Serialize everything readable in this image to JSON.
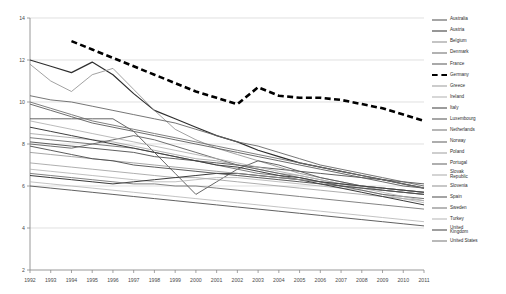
{
  "chart_data": {
    "type": "line",
    "title": "",
    "xlabel": "",
    "ylabel": "",
    "xlim": [
      1992,
      2011
    ],
    "ylim": [
      2,
      14
    ],
    "yticks": [
      2,
      4,
      6,
      8,
      10,
      12,
      14
    ],
    "grid": "horizontal",
    "legend_position": "right",
    "x": [
      1992,
      1993,
      1994,
      1995,
      1996,
      1997,
      1998,
      1999,
      2000,
      2001,
      2002,
      2003,
      2004,
      2005,
      2006,
      2007,
      2008,
      2009,
      2010,
      2011
    ],
    "highlight_series": "Germany",
    "colors": {
      "highlight": "#000000",
      "default_dark": "#3c3c3c",
      "default_mid": "#707070",
      "default_light": "#a8a8a8",
      "grid": "#d2d2d2",
      "axis": "#8c8c8c",
      "text": "#3a3a3a"
    },
    "series": [
      {
        "name": "Australia",
        "style": "solid",
        "width": 0.9,
        "color": "#4d4d4d",
        "values": [
          8.1,
          8.0,
          7.9,
          7.8,
          7.7,
          7.6,
          7.4,
          7.3,
          7.2,
          7.1,
          7.0,
          6.9,
          6.8,
          6.7,
          6.6,
          6.5,
          6.4,
          6.3,
          6.2,
          6.1
        ]
      },
      {
        "name": "Austria",
        "style": "solid",
        "width": 1.2,
        "color": "#2e2e2e",
        "values": [
          12.0,
          11.7,
          11.4,
          11.9,
          11.3,
          10.4,
          9.6,
          9.2,
          8.8,
          8.4,
          8.1,
          7.7,
          7.4,
          7.1,
          6.9,
          6.7,
          6.5,
          6.3,
          6.1,
          5.9
        ]
      },
      {
        "name": "Belgium",
        "style": "solid",
        "width": 0.8,
        "color": "#8a8a8a",
        "values": [
          11.8,
          11.0,
          10.5,
          11.3,
          11.6,
          10.6,
          9.6,
          8.7,
          8.2,
          7.8,
          7.5,
          7.2,
          6.9,
          6.6,
          6.4,
          6.2,
          6.0,
          5.8,
          5.7,
          5.6
        ]
      },
      {
        "name": "Denmark",
        "style": "solid",
        "width": 0.9,
        "color": "#666666",
        "values": [
          10.3,
          10.1,
          10.0,
          9.8,
          9.6,
          9.4,
          9.2,
          9.0,
          8.7,
          8.4,
          8.1,
          7.9,
          7.6,
          7.3,
          7.0,
          6.8,
          6.6,
          6.4,
          6.2,
          6.0
        ]
      },
      {
        "name": "France",
        "style": "solid",
        "width": 0.9,
        "color": "#555555",
        "values": [
          9.2,
          9.2,
          9.2,
          9.2,
          9.2,
          8.6,
          7.6,
          6.6,
          5.6,
          6.2,
          6.8,
          7.2,
          7.0,
          6.7,
          6.4,
          6.2,
          6.0,
          5.9,
          5.8,
          5.7
        ]
      },
      {
        "name": "Germany",
        "style": "dashed",
        "width": 2.6,
        "color": "#000000",
        "values": [
          null,
          null,
          12.9,
          12.5,
          12.1,
          11.7,
          11.3,
          10.9,
          10.5,
          10.2,
          9.9,
          10.7,
          10.3,
          10.2,
          10.2,
          10.1,
          9.9,
          9.7,
          9.4,
          9.1
        ]
      },
      {
        "name": "Greece",
        "style": "solid",
        "width": 0.8,
        "color": "#9a9a9a",
        "values": [
          7.1,
          7.0,
          6.9,
          6.8,
          6.7,
          6.6,
          6.5,
          6.4,
          6.4,
          6.3,
          6.2,
          6.1,
          6.0,
          5.9,
          5.8,
          5.7,
          5.6,
          5.5,
          5.4,
          5.3
        ]
      },
      {
        "name": "Ireland",
        "style": "solid",
        "width": 0.8,
        "color": "#b0b0b0",
        "values": [
          6.8,
          6.7,
          6.6,
          6.5,
          6.4,
          6.3,
          6.2,
          6.2,
          6.3,
          6.4,
          6.4,
          6.3,
          6.2,
          6.1,
          6.0,
          5.9,
          5.8,
          5.6,
          5.4,
          5.2
        ]
      },
      {
        "name": "Italy",
        "style": "solid",
        "width": 1.0,
        "color": "#3a3a3a",
        "values": [
          6.5,
          6.4,
          6.3,
          6.2,
          6.1,
          6.2,
          6.3,
          6.4,
          6.5,
          6.6,
          6.6,
          6.5,
          6.4,
          6.3,
          6.1,
          5.9,
          5.7,
          5.5,
          5.3,
          5.1
        ]
      },
      {
        "name": "Luxembourg",
        "style": "solid",
        "width": 0.9,
        "color": "#4f4f4f",
        "values": [
          6.0,
          5.9,
          5.8,
          5.7,
          5.6,
          5.5,
          5.4,
          5.3,
          5.2,
          5.1,
          5.0,
          4.9,
          4.8,
          4.7,
          4.6,
          4.5,
          4.4,
          4.3,
          4.2,
          4.1
        ]
      },
      {
        "name": "Netherlands",
        "style": "solid",
        "width": 0.9,
        "color": "#6e6e6e",
        "values": [
          8.3,
          8.2,
          8.1,
          8.0,
          7.9,
          7.8,
          7.6,
          7.4,
          7.2,
          7.0,
          6.8,
          6.6,
          6.5,
          6.3,
          6.2,
          6.0,
          5.9,
          5.8,
          5.7,
          5.6
        ]
      },
      {
        "name": "Norway",
        "style": "solid",
        "width": 0.9,
        "color": "#5c5c5c",
        "values": [
          9.9,
          9.6,
          9.3,
          9.0,
          8.8,
          8.6,
          8.4,
          8.2,
          8.0,
          7.8,
          7.6,
          7.4,
          7.2,
          7.0,
          6.8,
          6.6,
          6.4,
          6.2,
          6.0,
          5.9
        ]
      },
      {
        "name": "Poland",
        "style": "solid",
        "width": 0.8,
        "color": "#9d9d9d",
        "values": [
          8.5,
          8.4,
          8.3,
          8.2,
          8.1,
          7.9,
          7.7,
          7.5,
          7.3,
          7.2,
          7.0,
          6.8,
          6.6,
          6.5,
          6.3,
          6.1,
          6.0,
          5.9,
          5.8,
          5.7
        ]
      },
      {
        "name": "Portugal",
        "style": "solid",
        "width": 0.9,
        "color": "#606060",
        "values": [
          8.0,
          7.9,
          7.8,
          8.0,
          8.2,
          8.4,
          8.2,
          7.9,
          7.6,
          7.3,
          7.0,
          6.8,
          6.6,
          6.4,
          6.2,
          6.0,
          5.8,
          5.6,
          5.5,
          5.4
        ]
      },
      {
        "name": "Slovak Republic",
        "style": "solid",
        "width": 0.8,
        "color": "#aaaaaa",
        "values": [
          9.1,
          8.9,
          8.7,
          8.5,
          8.3,
          8.1,
          7.9,
          7.7,
          7.5,
          7.3,
          7.1,
          6.9,
          6.7,
          6.5,
          6.3,
          6.1,
          5.9,
          5.7,
          5.5,
          5.3
        ]
      },
      {
        "name": "Slovenia",
        "style": "solid",
        "width": 0.8,
        "color": "#8f8f8f",
        "values": [
          7.6,
          7.5,
          7.4,
          7.3,
          7.2,
          7.1,
          7.0,
          6.9,
          6.8,
          6.7,
          6.6,
          6.5,
          6.4,
          6.3,
          6.2,
          6.1,
          6.0,
          5.9,
          5.8,
          5.7
        ]
      },
      {
        "name": "Spain",
        "style": "solid",
        "width": 0.9,
        "color": "#4a4a4a",
        "values": [
          7.9,
          7.7,
          7.5,
          7.3,
          7.2,
          7.0,
          6.9,
          6.8,
          6.7,
          6.6,
          6.5,
          6.4,
          6.3,
          6.2,
          6.1,
          6.0,
          5.9,
          5.8,
          5.7,
          5.6
        ]
      },
      {
        "name": "Sweden",
        "style": "solid",
        "width": 0.9,
        "color": "#707070",
        "values": [
          10.0,
          9.7,
          9.4,
          9.1,
          8.9,
          8.7,
          8.5,
          8.3,
          8.1,
          7.9,
          7.7,
          7.5,
          7.3,
          7.1,
          6.9,
          6.7,
          6.5,
          6.3,
          6.1,
          5.9
        ]
      },
      {
        "name": "Turkey",
        "style": "solid",
        "width": 0.8,
        "color": "#b4b4b4",
        "values": [
          6.2,
          6.1,
          6.0,
          5.9,
          5.8,
          5.7,
          5.6,
          5.5,
          5.4,
          5.3,
          5.2,
          5.1,
          5.0,
          4.9,
          4.8,
          4.7,
          4.6,
          4.5,
          4.4,
          4.3
        ]
      },
      {
        "name": "United Kingdom",
        "style": "solid",
        "width": 1.0,
        "color": "#3f3f3f",
        "values": [
          8.8,
          8.6,
          8.4,
          8.2,
          8.0,
          7.8,
          7.6,
          7.4,
          7.2,
          7.0,
          6.9,
          6.7,
          6.5,
          6.4,
          6.2,
          6.1,
          6.0,
          5.9,
          5.8,
          5.7
        ]
      },
      {
        "name": "United States",
        "style": "solid",
        "width": 0.9,
        "color": "#757575",
        "values": [
          6.6,
          6.5,
          6.4,
          6.3,
          6.2,
          6.1,
          6.1,
          6.0,
          6.0,
          5.9,
          5.8,
          5.7,
          5.6,
          5.5,
          5.4,
          5.3,
          5.2,
          5.1,
          5.0,
          4.9
        ]
      }
    ]
  },
  "axis": {
    "yticks": [
      "2",
      "4",
      "6",
      "8",
      "10",
      "12",
      "14"
    ],
    "xticks": [
      "1992",
      "1993",
      "1994",
      "1995",
      "1996",
      "1997",
      "1998",
      "1999",
      "2000",
      "2001",
      "2002",
      "2003",
      "2004",
      "2005",
      "2006",
      "2007",
      "2008",
      "2009",
      "2010",
      "2011"
    ]
  },
  "legend": {
    "items": [
      {
        "label": "Australia"
      },
      {
        "label": "Austria"
      },
      {
        "label": "Belgium"
      },
      {
        "label": "Denmark"
      },
      {
        "label": "France"
      },
      {
        "label": "Germany"
      },
      {
        "label": "Greece"
      },
      {
        "label": "Ireland"
      },
      {
        "label": "Italy"
      },
      {
        "label": "Luxembourg"
      },
      {
        "label": "Netherlands"
      },
      {
        "label": "Norway"
      },
      {
        "label": "Poland"
      },
      {
        "label": "Portugal"
      },
      {
        "label": "Slovak\nRepublic"
      },
      {
        "label": "Slovenia"
      },
      {
        "label": "Spain"
      },
      {
        "label": "Sweden"
      },
      {
        "label": "Turkey"
      },
      {
        "label": "United\nKingdom"
      },
      {
        "label": "United States"
      }
    ]
  }
}
